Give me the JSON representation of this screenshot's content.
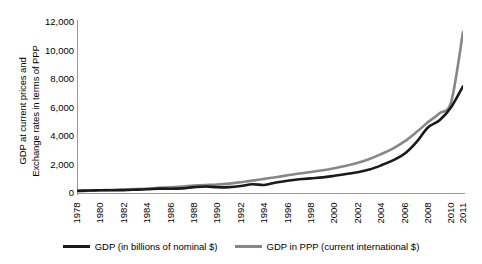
{
  "chart_data": {
    "type": "line",
    "title": "",
    "subtitle": "",
    "xlabel": "",
    "ylabel": "GDP at current prices and Exchange rates in terms of PPP",
    "ylabel_lines": [
      "GDP at current prices and",
      "Exchange rates in terms of PPP"
    ],
    "grid": false,
    "legend_position": "bottom",
    "xlim": [
      1978,
      2011
    ],
    "ylim": [
      0,
      12000
    ],
    "y_ticks": [
      0,
      2000,
      4000,
      6000,
      8000,
      10000,
      12000
    ],
    "y_tick_labels": [
      "0",
      "2,000",
      "4,000",
      "6,000",
      "8,000",
      "10,000",
      "12,000"
    ],
    "x_tick_labels": [
      "1978",
      "1980",
      "1982",
      "1984",
      "1986",
      "1988",
      "1990",
      "1992",
      "1994",
      "1996",
      "1998",
      "2000",
      "2002",
      "2004",
      "2006",
      "2008",
      "2010",
      "2011"
    ],
    "x_tick_values": [
      1978,
      1980,
      1982,
      1984,
      1986,
      1988,
      1990,
      1992,
      1994,
      1996,
      1998,
      2000,
      2002,
      2004,
      2006,
      2008,
      2010,
      2011
    ],
    "x": [
      1978,
      1979,
      1980,
      1981,
      1982,
      1983,
      1984,
      1985,
      1986,
      1987,
      1988,
      1989,
      1990,
      1991,
      1992,
      1993,
      1994,
      1995,
      1996,
      1997,
      1998,
      1999,
      2000,
      2001,
      2002,
      2003,
      2004,
      2005,
      2006,
      2007,
      2008,
      2009,
      2010,
      2011
    ],
    "series": [
      {
        "name": "GDP (in billions of nominal $)",
        "color": "#1a1a1a",
        "width": 2.6,
        "values": [
          150,
          177,
          189,
          195,
          205,
          230,
          260,
          307,
          300,
          327,
          410,
          461,
          399,
          413,
          493,
          617,
          563,
          734,
          863,
          962,
          1029,
          1094,
          1205,
          1332,
          1461,
          1649,
          1941,
          2286,
          2752,
          3552,
          4598,
          5110,
          6040,
          7490
        ]
      },
      {
        "name": "GDP in PPP (current international $)",
        "color": "#878787",
        "width": 2.6,
        "values": [
          137,
          160,
          188,
          212,
          238,
          270,
          315,
          364,
          404,
          457,
          520,
          561,
          591,
          660,
          760,
          870,
          990,
          1110,
          1240,
          1370,
          1470,
          1590,
          1740,
          1910,
          2120,
          2390,
          2730,
          3120,
          3620,
          4260,
          4960,
          5600,
          6430,
          11300
        ]
      }
    ],
    "legend": [
      {
        "label": "GDP (in billions of nominal $)",
        "color": "#1a1a1a",
        "swatch": "line-swatch-black"
      },
      {
        "label": "GDP in PPP (current international $)",
        "color": "#878787",
        "swatch": "line-swatch-gray"
      }
    ]
  },
  "colors": {
    "nominal": "#1a1a1a",
    "ppp": "#878787",
    "axis": "#9a9a9a",
    "background": "#ffffff",
    "text": "#000000"
  }
}
